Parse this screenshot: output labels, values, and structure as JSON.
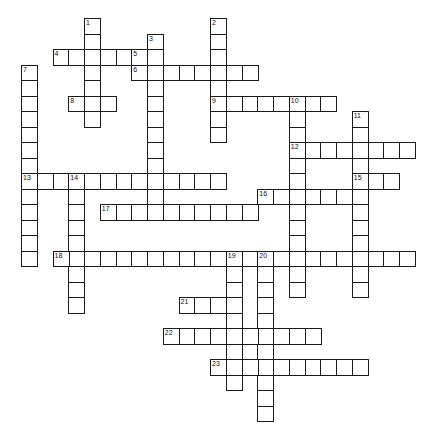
{
  "puzzle": {
    "type": "crossword",
    "grid": {
      "origin_x": 21,
      "origin_y": 18,
      "cell_w": 15.75,
      "cell_h": 15.5
    },
    "colors": {
      "border": "#1a1a1a",
      "background": "#ffffff",
      "number": "#111111"
    },
    "words": [
      {
        "number": "1",
        "dir": "down",
        "col": 4,
        "row": 0,
        "length": 7
      },
      {
        "number": "2",
        "dir": "down",
        "col": 12,
        "row": 0,
        "length": 8
      },
      {
        "number": "3",
        "dir": "down",
        "col": 8,
        "row": 1,
        "length": 12
      },
      {
        "number": "4",
        "dir": "across",
        "col": 2,
        "row": 2,
        "length": 7
      },
      {
        "number": "5",
        "dir": "down",
        "col": 7,
        "row": 2,
        "length": 2
      },
      {
        "number": "6",
        "dir": "across",
        "col": 7,
        "row": 3,
        "length": 8
      },
      {
        "number": "7",
        "dir": "down",
        "col": 0,
        "row": 3,
        "length": 13
      },
      {
        "number": "8",
        "dir": "across",
        "col": 3,
        "row": 5,
        "length": 3
      },
      {
        "number": "9",
        "dir": "across",
        "col": 12,
        "row": 5,
        "length": 8
      },
      {
        "number": "10",
        "dir": "down",
        "col": 17,
        "row": 5,
        "length": 13
      },
      {
        "number": "11",
        "dir": "down",
        "col": 21,
        "row": 6,
        "length": 12
      },
      {
        "number": "12",
        "dir": "across",
        "col": 17,
        "row": 8,
        "length": 8
      },
      {
        "number": "13",
        "dir": "across",
        "col": 0,
        "row": 10,
        "length": 13
      },
      {
        "number": "14",
        "dir": "down",
        "col": 3,
        "row": 10,
        "length": 9
      },
      {
        "number": "15",
        "dir": "across",
        "col": 21,
        "row": 10,
        "length": 3
      },
      {
        "number": "16",
        "dir": "across",
        "col": 15,
        "row": 11,
        "length": 7
      },
      {
        "number": "17",
        "dir": "across",
        "col": 5,
        "row": 12,
        "length": 10
      },
      {
        "number": "18",
        "dir": "across",
        "col": 2,
        "row": 15,
        "length": 23
      },
      {
        "number": "19",
        "dir": "down",
        "col": 13,
        "row": 15,
        "length": 9
      },
      {
        "number": "20",
        "dir": "down",
        "col": 15,
        "row": 15,
        "length": 11
      },
      {
        "number": "21",
        "dir": "across",
        "col": 10,
        "row": 18,
        "length": 4
      },
      {
        "number": "22",
        "dir": "across",
        "col": 9,
        "row": 20,
        "length": 10
      },
      {
        "number": "23",
        "dir": "across",
        "col": 12,
        "row": 22,
        "length": 10
      }
    ]
  }
}
